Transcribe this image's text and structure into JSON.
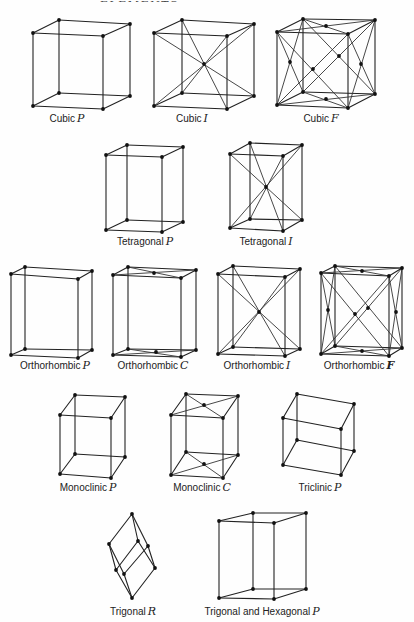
{
  "header": {
    "running_title": "CRYSTAL SYMMETRY ELEMENTS",
    "page_number": "35"
  },
  "lattices": [
    {
      "id": "cubic-p",
      "name": "Cubic",
      "symbol": "P",
      "label_x": 67,
      "label_y": 113,
      "v": {
        "ftl": [
          33,
          33
        ],
        "ftr": [
          103,
          36
        ],
        "btl": [
          59,
          20
        ],
        "btr": [
          130,
          24
        ],
        "fbl": [
          33,
          106
        ],
        "fbr": [
          103,
          109
        ],
        "bbl": [
          59,
          93
        ],
        "bbr": [
          130,
          96
        ]
      },
      "extra_points": [],
      "extra_lines": []
    },
    {
      "id": "cubic-i",
      "name": "Cubic",
      "symbol": "I",
      "label_x": 192,
      "label_y": 113,
      "v": {
        "ftl": [
          154,
          33
        ],
        "ftr": [
          227,
          36
        ],
        "btl": [
          182,
          20
        ],
        "btr": [
          254,
          24
        ],
        "fbl": [
          154,
          106
        ],
        "fbr": [
          227,
          109
        ],
        "bbl": [
          182,
          93
        ],
        "bbr": [
          254,
          96
        ]
      },
      "extra_points": [
        [
          204,
          64
        ]
      ],
      "extra_lines": [
        [
          "ftl",
          "bbr"
        ],
        [
          "ftr",
          "bbl"
        ],
        [
          "btl",
          "fbr"
        ],
        [
          "btr",
          "fbl"
        ]
      ]
    },
    {
      "id": "cubic-f",
      "name": "Cubic",
      "symbol": "F",
      "label_x": 321,
      "label_y": 113,
      "v": {
        "ftl": [
          277,
          32
        ],
        "ftr": [
          348,
          34
        ],
        "btl": [
          303,
          19
        ],
        "btr": [
          375,
          20
        ],
        "fbl": [
          277,
          105
        ],
        "fbr": [
          348,
          108
        ],
        "bbl": [
          303,
          92
        ],
        "bbr": [
          375,
          94
        ]
      },
      "extra_points": [
        [
          326,
          26
        ],
        [
          326,
          99
        ],
        [
          290,
          62
        ],
        [
          361,
          64
        ],
        [
          313,
          69
        ],
        [
          339,
          56
        ]
      ],
      "extra_lines": [
        [
          "ftl",
          "btr"
        ],
        [
          "ftr",
          "btl"
        ],
        [
          "fbl",
          "bbr"
        ],
        [
          "fbr",
          "bbl"
        ],
        [
          "ftl",
          "fbr"
        ],
        [
          "ftr",
          "fbl"
        ],
        [
          "btl",
          "bbr"
        ],
        [
          "btr",
          "bbl"
        ],
        [
          "ftl",
          "bbl"
        ],
        [
          "btl",
          "fbl"
        ],
        [
          "ftr",
          "bbr"
        ],
        [
          "btr",
          "fbr"
        ]
      ]
    },
    {
      "id": "tetragonal-p",
      "name": "Tetragonal",
      "symbol": "P",
      "label_x": 145,
      "label_y": 236,
      "v": {
        "ftl": [
          106,
          155
        ],
        "ftr": [
          162,
          157
        ],
        "btl": [
          127,
          145
        ],
        "btr": [
          183,
          147
        ],
        "fbl": [
          106,
          230
        ],
        "fbr": [
          162,
          232
        ],
        "bbl": [
          127,
          220
        ],
        "bbr": [
          183,
          222
        ]
      },
      "extra_points": [],
      "extra_lines": []
    },
    {
      "id": "tetragonal-i",
      "name": "Tetragonal",
      "symbol": "I",
      "label_x": 266,
      "label_y": 236,
      "v": {
        "ftl": [
          230,
          154
        ],
        "ftr": [
          283,
          156
        ],
        "btl": [
          250,
          143
        ],
        "btr": [
          302,
          145
        ],
        "fbl": [
          230,
          228
        ],
        "fbr": [
          283,
          231
        ],
        "bbl": [
          250,
          219
        ],
        "bbr": [
          302,
          220
        ]
      },
      "extra_points": [
        [
          266,
          187
        ]
      ],
      "extra_lines": [
        [
          "ftl",
          "bbr"
        ],
        [
          "ftr",
          "bbl"
        ],
        [
          "btl",
          "fbr"
        ],
        [
          "btr",
          "fbl"
        ]
      ]
    },
    {
      "id": "orthorhombic-p",
      "name": "Orthorhombic",
      "symbol": "P",
      "label_x": 55,
      "label_y": 360,
      "v": {
        "ftl": [
          11,
          274
        ],
        "ftr": [
          78,
          279
        ],
        "btl": [
          25,
          267
        ],
        "btr": [
          92,
          271
        ],
        "fbl": [
          11,
          355
        ],
        "fbr": [
          78,
          358
        ],
        "bbl": [
          25,
          349
        ],
        "bbr": [
          92,
          350
        ]
      },
      "extra_points": [],
      "extra_lines": []
    },
    {
      "id": "orthorhombic-c",
      "name": "Orthorhombic",
      "symbol": "C",
      "label_x": 153,
      "label_y": 360,
      "v": {
        "ftl": [
          113,
          275
        ],
        "ftr": [
          181,
          278
        ],
        "btl": [
          128,
          267
        ],
        "btr": [
          196,
          270
        ],
        "fbl": [
          113,
          355
        ],
        "fbr": [
          181,
          357
        ],
        "bbl": [
          128,
          349
        ],
        "bbr": [
          196,
          350
        ]
      },
      "extra_points": [
        [
          154,
          273
        ],
        [
          156,
          352
        ]
      ],
      "extra_lines": [
        [
          "ftl",
          "btr"
        ],
        [
          "ftr",
          "btl"
        ],
        [
          "fbl",
          "bbr"
        ],
        [
          "fbr",
          "bbl"
        ]
      ]
    },
    {
      "id": "orthorhombic-i",
      "name": "Orthorhombic",
      "symbol": "I",
      "label_x": 257,
      "label_y": 360,
      "v": {
        "ftl": [
          218,
          274
        ],
        "ftr": [
          285,
          277
        ],
        "btl": [
          233,
          266
        ],
        "btr": [
          300,
          269
        ],
        "fbl": [
          218,
          354
        ],
        "fbr": [
          285,
          356
        ],
        "bbl": [
          233,
          347
        ],
        "bbr": [
          300,
          349
        ]
      },
      "extra_points": [
        [
          259,
          312
        ]
      ],
      "extra_lines": [
        [
          "ftl",
          "bbr"
        ],
        [
          "ftr",
          "bbl"
        ],
        [
          "btl",
          "fbr"
        ],
        [
          "btr",
          "fbl"
        ]
      ]
    },
    {
      "id": "orthorhombic-f",
      "name": "Orthorhombic",
      "symbol": "F",
      "label_x": 359,
      "label_y": 360,
      "v": {
        "ftl": [
          321,
          273
        ],
        "ftr": [
          389,
          276
        ],
        "btl": [
          335,
          266
        ],
        "btr": [
          402,
          268
        ],
        "fbl": [
          321,
          354
        ],
        "fbr": [
          389,
          356
        ],
        "bbl": [
          335,
          346
        ],
        "bbr": [
          402,
          348
        ]
      },
      "extra_points": [
        [
          362,
          271
        ],
        [
          362,
          351
        ],
        [
          328,
          310
        ],
        [
          396,
          312
        ],
        [
          355,
          314
        ],
        [
          368,
          308
        ]
      ],
      "extra_lines": [
        [
          "ftl",
          "btr"
        ],
        [
          "ftr",
          "btl"
        ],
        [
          "fbl",
          "bbr"
        ],
        [
          "fbr",
          "bbl"
        ],
        [
          "ftl",
          "fbr"
        ],
        [
          "ftr",
          "fbl"
        ],
        [
          "btl",
          "bbr"
        ],
        [
          "btr",
          "bbl"
        ],
        [
          "ftl",
          "bbl"
        ],
        [
          "btl",
          "fbl"
        ],
        [
          "ftr",
          "bbr"
        ],
        [
          "btr",
          "fbr"
        ]
      ]
    },
    {
      "id": "monoclinic-p",
      "name": "Monoclinic",
      "symbol": "P",
      "label_x": 88,
      "label_y": 482,
      "v": {
        "ftl": [
          60,
          415
        ],
        "ftr": [
          111,
          418
        ],
        "btl": [
          75,
          395
        ],
        "btr": [
          125,
          397
        ],
        "fbl": [
          60,
          474
        ],
        "fbr": [
          111,
          478
        ],
        "bbl": [
          75,
          454
        ],
        "bbr": [
          125,
          457
        ]
      },
      "extra_points": [],
      "extra_lines": []
    },
    {
      "id": "monoclinic-c",
      "name": "Monoclinic",
      "symbol": "C",
      "label_x": 202,
      "label_y": 482,
      "v": {
        "ftl": [
          171,
          415
        ],
        "ftr": [
          223,
          418
        ],
        "btl": [
          186,
          394
        ],
        "btr": [
          238,
          396
        ],
        "fbl": [
          171,
          475
        ],
        "fbr": [
          223,
          478
        ],
        "bbl": [
          186,
          452
        ],
        "bbr": [
          238,
          455
        ]
      },
      "extra_points": [
        [
          204,
          405
        ],
        [
          204,
          464
        ]
      ],
      "extra_lines": [
        [
          "ftl",
          "btr"
        ],
        [
          "ftr",
          "btl"
        ],
        [
          "fbl",
          "bbr"
        ],
        [
          "fbr",
          "bbl"
        ]
      ]
    },
    {
      "id": "triclinic-p",
      "name": "Triclinic",
      "symbol": "P",
      "label_x": 320,
      "label_y": 482,
      "v": {
        "ftl": [
          283,
          418
        ],
        "ftr": [
          341,
          429
        ],
        "btl": [
          297,
          394
        ],
        "btr": [
          354,
          404
        ],
        "fbl": [
          283,
          465
        ],
        "fbr": [
          341,
          475
        ],
        "bbl": [
          297,
          440
        ],
        "bbr": [
          354,
          451
        ]
      },
      "extra_points": [],
      "extra_lines": []
    },
    {
      "id": "trigonal-r",
      "name": "Trigonal",
      "symbol": "R",
      "label_x": 133,
      "label_y": 606,
      "v": {
        "ftl": [
          109,
          544
        ],
        "ftr": [
          138,
          541
        ],
        "btl": [
          132,
          514
        ],
        "btr": [
          148,
          546
        ],
        "fbl": [
          116,
          570
        ],
        "fbr": [
          124,
          574
        ],
        "bbl": [
          132,
          598
        ],
        "bbr": [
          155,
          568
        ]
      },
      "rhombo": true,
      "extra_points": [],
      "extra_lines": []
    },
    {
      "id": "hexagonal-p",
      "name": "Trigonal and Hexagonal",
      "symbol": "P",
      "label_x": 262,
      "label_y": 606,
      "v": {
        "ftl": [
          219,
          521
        ],
        "ftr": [
          274,
          523
        ],
        "btl": [
          253,
          513
        ],
        "btr": [
          306,
          513
        ],
        "fbl": [
          219,
          598
        ],
        "fbr": [
          274,
          599
        ],
        "bbl": [
          253,
          589
        ],
        "bbr": [
          306,
          589
        ]
      },
      "extra_points": [],
      "extra_lines": []
    }
  ]
}
